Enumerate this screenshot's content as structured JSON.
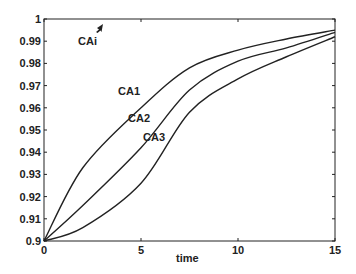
{
  "chart_data": {
    "type": "line",
    "title": "",
    "xlabel": "time",
    "ylabel": "",
    "xlim": [
      0,
      15
    ],
    "ylim": [
      0.9,
      1.0
    ],
    "grid": false,
    "legend": "none (inline curve labels)",
    "x_ticks": [
      "0",
      "5",
      "10",
      "15"
    ],
    "y_ticks": [
      "0.9",
      "0.91",
      "0.92",
      "0.93",
      "0.94",
      "0.95",
      "0.96",
      "0.97",
      "0.98",
      "0.99",
      "1"
    ],
    "x": [
      0,
      2,
      5,
      7.5,
      10,
      12.5,
      15
    ],
    "series": [
      {
        "name": "CA1",
        "values": [
          0.9,
          0.933,
          0.96,
          0.978,
          0.986,
          0.991,
          0.995
        ]
      },
      {
        "name": "CA2",
        "values": [
          0.9,
          0.916,
          0.942,
          0.968,
          0.981,
          0.987,
          0.994
        ]
      },
      {
        "name": "CA3",
        "values": [
          0.9,
          0.906,
          0.926,
          0.958,
          0.973,
          0.983,
          0.992
        ]
      }
    ],
    "annotations": [
      {
        "text": "CAi",
        "note": "arrow pointing toward upper axis (inlet concentration ~1)"
      },
      {
        "text": "CA1"
      },
      {
        "text": "CA2"
      },
      {
        "text": "CA3"
      }
    ]
  },
  "labels": {
    "xlabel": "time",
    "cai": "CAi",
    "ca1": "CA1",
    "ca2": "CA2",
    "ca3": "CA3"
  }
}
